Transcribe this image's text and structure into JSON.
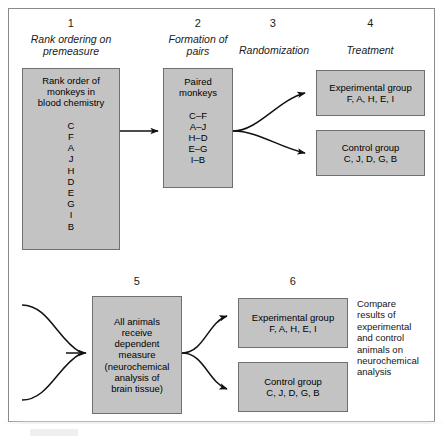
{
  "figure": {
    "fill_color": "#c3c3c3",
    "border_color": "#6f6f6f",
    "frame_color": "#8a8a8a"
  },
  "steps": {
    "s1": {
      "number": "1",
      "phase": "Rank ordering\non premeasure"
    },
    "s2": {
      "number": "2",
      "phase": "Formation\nof pairs"
    },
    "s3": {
      "number": "3",
      "phase": "Randomization"
    },
    "s4": {
      "number": "4",
      "phase": "Treatment"
    },
    "s5": {
      "number": "5"
    },
    "s6": {
      "number": "6"
    }
  },
  "boxes": {
    "rank_order": {
      "heading": "Rank order of\nmonkeys in\nblood chemistry",
      "letters": "C\nF\nA\nJ\nH\nD\nE\nG\nI\nB",
      "full": "Rank order of\nmonkeys in\nblood chemistry\n\nC\nF\nA\nJ\nH\nD\nE\nG\nI\nB"
    },
    "paired_monkeys": {
      "heading": "Paired\nmonkeys",
      "pairs": "C–F\nA–J\nH–D\nE–G\nI–B",
      "full": "Paired\nmonkeys\n\nC–F\nA–J\nH–D\nE–G\nI–B"
    },
    "experimental_top": {
      "label": "Experimental group",
      "members": "F, A, H, E, I",
      "full": "Experimental group\nF, A, H, E, I"
    },
    "control_top": {
      "label": "Control group",
      "members": "C, J, D, G, B",
      "full": "Control group\nC, J, D, G, B"
    },
    "dependent_measure": {
      "full": "All animals\nreceive\ndependent\nmeasure\n(neurochemical\nanalysis of\nbrain tissue)"
    },
    "experimental_bottom": {
      "label": "Experimental group",
      "members": "F, A, H, E, I",
      "full": "Experimental group\nF, A, H, E, I"
    },
    "control_bottom": {
      "label": "Control group",
      "members": "C, J, D, G, B",
      "full": "Control group\nC, J, D, G, B"
    }
  },
  "compare_note": {
    "text": "Compare\nresults of\nexperimental\nand control\nanimals on\nneurochemical\nanalysis"
  }
}
